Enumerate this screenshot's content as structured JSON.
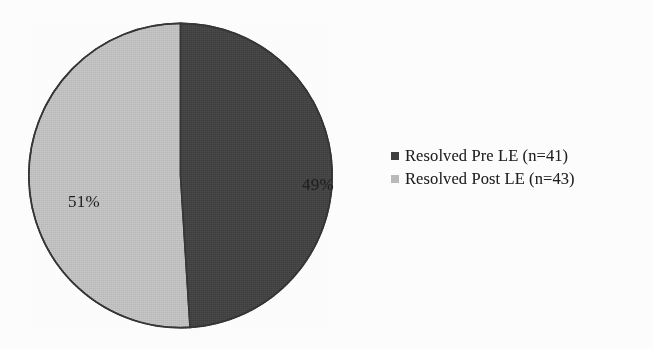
{
  "chart_data": {
    "type": "pie",
    "title": "",
    "subtitle": "",
    "xlabel": "",
    "ylabel": "",
    "grid": false,
    "legend_position": "right",
    "start_angle_deg": 0,
    "direction": "clockwise",
    "categories": [
      "Resolved Pre LE (n=41)",
      "Resolved Post LE (n=43)"
    ],
    "values": [
      49,
      51
    ],
    "counts": [
      41,
      43
    ],
    "value_unit": "%",
    "slices": [
      {
        "label": "Resolved Pre LE (n=41)",
        "series_name": "Resolved Pre LE",
        "data_label": "49%",
        "percent": 49,
        "count": 41,
        "color": "#3b3b3b"
      },
      {
        "label": "Resolved Post LE (n=43)",
        "series_name": "Resolved Post LE",
        "data_label": "51%",
        "percent": 51,
        "count": 43,
        "color": "#b9b9b9"
      }
    ],
    "legend": [
      {
        "label": "Resolved Pre LE (n=41)",
        "color": "#3b3b3b",
        "marker": "square"
      },
      {
        "label": "Resolved Post LE (n=43)",
        "color": "#b9b9b9",
        "marker": "square"
      }
    ]
  },
  "colors": {
    "background": "#fdfdfd",
    "dark_slice": "#3b3b3b",
    "light_slice": "#b9b9b9",
    "outline": "#2e2e2e",
    "label_text": "#1a1a1a",
    "legend_text": "#1c1c1c"
  }
}
